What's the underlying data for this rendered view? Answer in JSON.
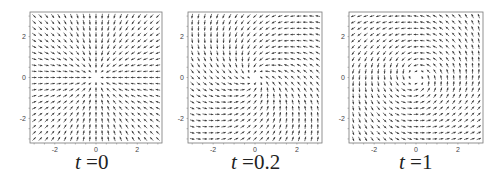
{
  "figure": {
    "background": "#ffffff",
    "arrow_color": "#3a3a3a",
    "frame_color": "#777777"
  },
  "chart_data": [
    {
      "type": "vector_field",
      "title": "t =0",
      "caption_var": "t",
      "caption_value": "=0",
      "t": 0,
      "xlim": [
        -3.2,
        3.2
      ],
      "ylim": [
        -3.2,
        3.2
      ],
      "xticks": [
        -2,
        0,
        2
      ],
      "yticks": [
        -2,
        0,
        2
      ],
      "xtick_labels": [
        "-2",
        "0",
        "2"
      ],
      "ytick_labels": [
        "-2",
        "0",
        "2"
      ],
      "grid": [
        21,
        21
      ],
      "description": "Radial sink: all arrows point toward origin",
      "rotation_deg": 0,
      "twist": 0
    },
    {
      "type": "vector_field",
      "title": "t =0.2",
      "caption_var": "t",
      "caption_value": "=0.2",
      "t": 0.2,
      "xlim": [
        -3.2,
        3.2
      ],
      "ylim": [
        -3.2,
        3.2
      ],
      "xticks": [
        -2,
        0,
        2
      ],
      "yticks": [
        -2,
        0,
        2
      ],
      "xtick_labels": [
        "-2",
        "0",
        "2"
      ],
      "ytick_labels": [
        "-2",
        "0",
        "2"
      ],
      "grid": [
        21,
        21
      ],
      "description": "Slightly rotating sink toward origin",
      "rotation_deg": 30,
      "twist": 6
    },
    {
      "type": "vector_field",
      "title": "t =1",
      "caption_var": "t",
      "caption_value": "=1",
      "t": 1,
      "xlim": [
        -3.2,
        3.2
      ],
      "ylim": [
        -3.2,
        3.2
      ],
      "xticks": [
        -2,
        0,
        2
      ],
      "yticks": [
        -2,
        0,
        2
      ],
      "xtick_labels": [
        "-2",
        "0",
        "2"
      ],
      "ytick_labels": [
        "-2",
        "0",
        "2"
      ],
      "grid": [
        21,
        21
      ],
      "description": "Strong clockwise spiral sink around origin",
      "rotation_deg": 65,
      "twist": 12
    }
  ]
}
